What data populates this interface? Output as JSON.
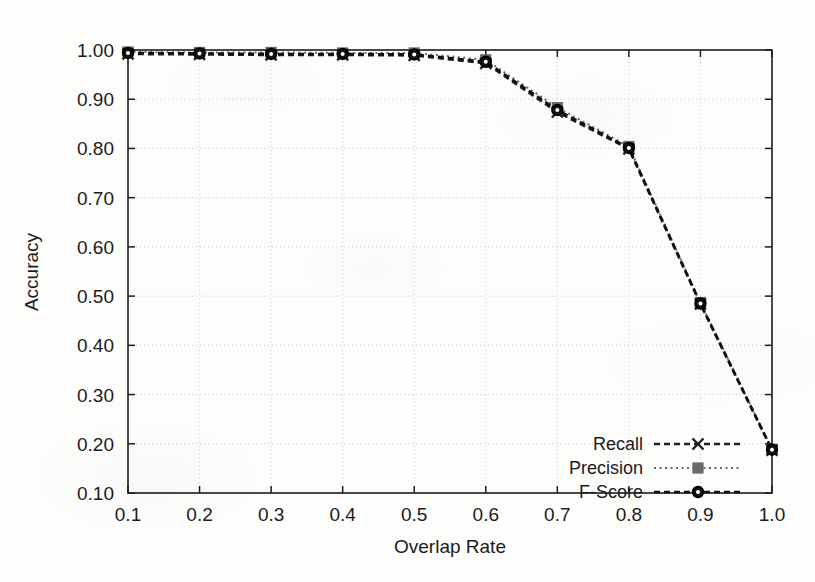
{
  "chart_data": {
    "type": "line",
    "title": "",
    "xlabel": "Overlap Rate",
    "ylabel": "Accuracy",
    "xlim": [
      0.1,
      1.0
    ],
    "ylim": [
      0.1,
      1.0
    ],
    "grid": true,
    "legend_position": "bottom-right",
    "x": [
      0.1,
      0.2,
      0.3,
      0.4,
      0.5,
      0.6,
      0.7,
      0.8,
      0.9,
      1.0
    ],
    "xtick_labels": [
      "0.1",
      "0.2",
      "0.3",
      "0.4",
      "0.5",
      "0.6",
      "0.7",
      "0.8",
      "0.9",
      "1.0"
    ],
    "ytick_labels": [
      "0.10",
      "0.20",
      "0.30",
      "0.40",
      "0.50",
      "0.60",
      "0.70",
      "0.80",
      "0.90",
      "1.00"
    ],
    "ytick_values": [
      0.1,
      0.2,
      0.3,
      0.4,
      0.5,
      0.6,
      0.7,
      0.8,
      0.9,
      1.0
    ],
    "series": [
      {
        "name": "Recall",
        "marker": "x-marker",
        "line_style": "dashed",
        "color": "#202020",
        "values": [
          0.992,
          0.991,
          0.99,
          0.99,
          0.989,
          0.973,
          0.874,
          0.799,
          0.484,
          0.187
        ]
      },
      {
        "name": "Precision",
        "marker": "square-marker",
        "line_style": "dotted",
        "color": "#6a6a6a",
        "values": [
          0.996,
          0.995,
          0.995,
          0.994,
          0.994,
          0.98,
          0.883,
          0.804,
          0.487,
          0.189
        ]
      },
      {
        "name": "F-Score",
        "marker": "circle-marker",
        "line_style": "dashed",
        "color": "#111111",
        "values": [
          0.994,
          0.993,
          0.992,
          0.992,
          0.991,
          0.976,
          0.878,
          0.801,
          0.485,
          0.188
        ]
      }
    ]
  },
  "axes": {
    "x_title": "Overlap Rate",
    "y_title": "Accuracy"
  },
  "legend": {
    "entries": [
      {
        "label": "Recall"
      },
      {
        "label": "Precision"
      },
      {
        "label": "F-Score"
      }
    ]
  },
  "colors": {
    "frame": "#1b1b1b",
    "grid": "#c9c9c9",
    "background": "#fdfdfc",
    "recall": "#202020",
    "precision": "#6a6a6a",
    "fscore": "#111111"
  }
}
